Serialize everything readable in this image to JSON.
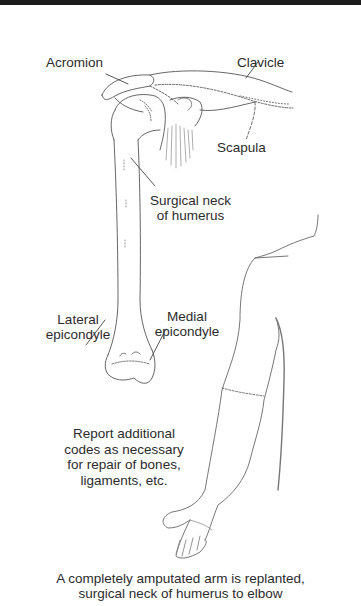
{
  "figure": {
    "labels": {
      "acromion": "Acromion",
      "clavicle": "Clavicle",
      "scapula": "Scapula",
      "surgical_neck_line1": "Surgical neck",
      "surgical_neck_line2": "of humerus",
      "lateral_epicondyle_line1": "Lateral",
      "lateral_epicondyle_line2": "epicondyle",
      "medial_epicondyle_line1": "Medial",
      "medial_epicondyle_line2": "epicondyle"
    },
    "note": {
      "line1": "Report additional",
      "line2": "codes as necessary",
      "line3": "for repair of bones,",
      "line4": "ligaments, etc."
    },
    "caption": {
      "line1": "A completely amputated arm is replanted,",
      "line2": "surgical neck of humerus to elbow"
    },
    "colors": {
      "ink": "#2b2b2b",
      "line": "#555555",
      "top_band": "#1c1c1c",
      "background": "#ffffff"
    }
  }
}
